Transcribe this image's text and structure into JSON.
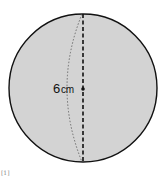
{
  "figure": {
    "shape": "sphere",
    "fill_color": "#d3d3d3",
    "outline_color": "#111111",
    "center": [
      83,
      88
    ],
    "radius": 74
  },
  "measurement": {
    "value": "6",
    "unit": "cm",
    "refers_to": "radius"
  },
  "corner_mark": "[1]"
}
